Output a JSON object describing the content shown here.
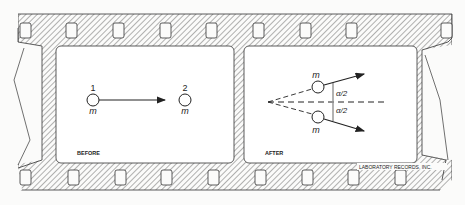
{
  "frames": {
    "before": {
      "label": "BEFORE",
      "ball1": {
        "number": "1",
        "mass": "m"
      },
      "ball2": {
        "number": "2",
        "mass": "m"
      }
    },
    "after": {
      "label": "AFTER",
      "ball_top": {
        "mass": "m",
        "angle": "α/2"
      },
      "ball_bottom": {
        "mass": "m",
        "angle": "α/2"
      }
    }
  },
  "credit": "LABORATORY RECORDS, INC.",
  "colors": {
    "ink": "#222222",
    "paper": "#fbfbfa",
    "frame": "#ffffff"
  }
}
